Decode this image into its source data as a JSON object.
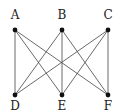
{
  "graph": {
    "nodes": [
      {
        "id": "A",
        "label": "A",
        "row": "top",
        "col": 0
      },
      {
        "id": "B",
        "label": "B",
        "row": "top",
        "col": 1
      },
      {
        "id": "C",
        "label": "C",
        "row": "top",
        "col": 2
      },
      {
        "id": "D",
        "label": "D",
        "row": "bottom",
        "col": 0
      },
      {
        "id": "E",
        "label": "E",
        "row": "bottom",
        "col": 1
      },
      {
        "id": "F",
        "label": "F",
        "row": "bottom",
        "col": 2
      }
    ],
    "edges": [
      [
        "A",
        "D"
      ],
      [
        "A",
        "E"
      ],
      [
        "A",
        "F"
      ],
      [
        "B",
        "D"
      ],
      [
        "B",
        "E"
      ],
      [
        "B",
        "F"
      ],
      [
        "C",
        "D"
      ],
      [
        "C",
        "E"
      ],
      [
        "C",
        "F"
      ]
    ]
  }
}
